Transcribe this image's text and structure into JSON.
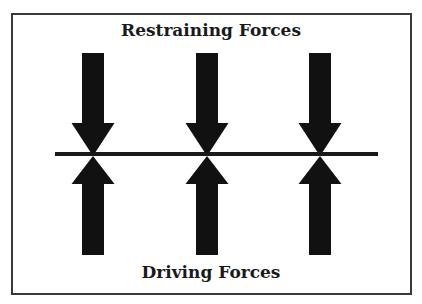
{
  "diagram": {
    "title_top": "Restraining Forces",
    "title_bottom": "Driving Forces",
    "equilibrium_line": {
      "x1": 55,
      "x2": 378,
      "y": 154,
      "thickness": 4
    },
    "arrow_columns": [
      93,
      207,
      320
    ],
    "restraining_arrows": {
      "direction": "down",
      "count": 3,
      "shaft_top": 53,
      "head_start": 123,
      "tip": 156
    },
    "driving_arrows": {
      "direction": "up",
      "count": 3,
      "tip": 156,
      "head_end": 184,
      "shaft_bottom": 255
    },
    "colors": {
      "arrow": "#111111",
      "line": "#1a1a1a",
      "border": "#3a3a3a",
      "background": "#ffffff"
    }
  }
}
